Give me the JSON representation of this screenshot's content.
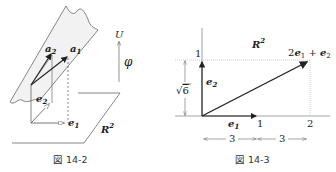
{
  "figures": [
    {
      "id": "fig-14-2",
      "caption": "図 14-2",
      "labels": {
        "a1": "a",
        "a1_sub": "1",
        "a2": "a",
        "a2_sub": "2",
        "e1": "e",
        "e1_sub": "1",
        "e2": "e",
        "e2_sub": "2",
        "U": "U",
        "phi": "φ",
        "R": "R",
        "R_sup": "2"
      }
    },
    {
      "id": "fig-14-3",
      "caption": "図 14-3",
      "labels": {
        "R": "R",
        "R_sup": "2",
        "e1": "e",
        "e1_sub": "1",
        "e2": "e",
        "e2_sub": "2",
        "sum_coef": "2",
        "sum_e1": "e",
        "sum_e1_sub": "1",
        "sum_plus": " + ",
        "sum_e2": "e",
        "sum_e2_sub": "2",
        "y_tick_1": "1",
        "x_tick_1": "1",
        "x_tick_2": "2",
        "sqrt6_radical": "√",
        "sqrt6_value": "6",
        "dim_left": "3",
        "dim_right": "3"
      }
    }
  ],
  "colors": {
    "line": "#333333",
    "light_line": "#888888",
    "plane_fill": "#f2f2f2",
    "dotted": "#999999"
  }
}
